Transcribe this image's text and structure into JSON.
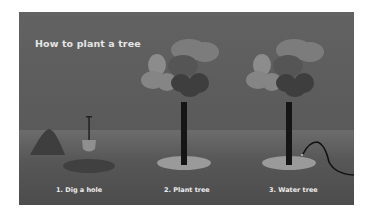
{
  "title": "How to plant a tree",
  "steps": [
    {
      "label": "1. Dig a hole"
    },
    {
      "label": "2. Plant tree"
    },
    {
      "label": "3. Water tree"
    }
  ],
  "icons": {
    "mound": "dirt-mound-icon",
    "shovel": "shovel-icon",
    "hole": "hole-icon",
    "tree": "tree-icon",
    "hose": "hose-icon"
  },
  "colors": {
    "sky": "#5e5e5e",
    "ground": "#575757",
    "trunk": "#1a1a1a",
    "foliage_light": "#8a8a8a",
    "foliage_mid": "#7a7a7a",
    "foliage_dark": "#404040",
    "base": "#9a9a9a",
    "text": "#e6e6e6"
  }
}
